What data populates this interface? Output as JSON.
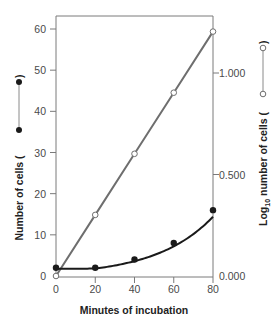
{
  "chart_data": {
    "type": "line",
    "title": "",
    "xlabel": "Minutes of incubation",
    "ylabel_left": "Number of cells",
    "ylabel_right": "Log10 number of cells",
    "ylabel_right_parts": {
      "prefix": "Log",
      "subscript": "10",
      "suffix": " number of cells ("
    },
    "ylabel_left_parts": {
      "text": "Number of cells ("
    },
    "x": [
      0,
      20,
      40,
      60,
      80
    ],
    "xlim": [
      0,
      80
    ],
    "x_ticks": [
      "0",
      "20",
      "40",
      "60",
      "80"
    ],
    "ylim_left": [
      0,
      60
    ],
    "y_ticks_left": [
      "0",
      "10",
      "20",
      "30",
      "40",
      "50",
      "60"
    ],
    "ylim_right": [
      0,
      1.237
    ],
    "y_ticks_right": [
      "0.000",
      "0.500",
      "1.000"
    ],
    "grid": false,
    "legend": "inline in axis titles (filled circle line = left axis, open circle line = right axis)",
    "series": [
      {
        "name": "Number of cells",
        "axis": "left",
        "marker": "filled-circle",
        "color": "#1a1a1a",
        "values": [
          2,
          2,
          4,
          8,
          16
        ]
      },
      {
        "name": "Log10 number of cells",
        "axis": "right",
        "marker": "open-circle",
        "color": "#6e6e6e",
        "values": [
          0.0,
          0.301,
          0.602,
          0.903,
          1.204
        ]
      }
    ]
  },
  "colors": {
    "filled_series": "#1a1a1a",
    "open_series": "#6e6e6e",
    "axis": "#7a7a7a",
    "text": "#4a4a4a"
  }
}
